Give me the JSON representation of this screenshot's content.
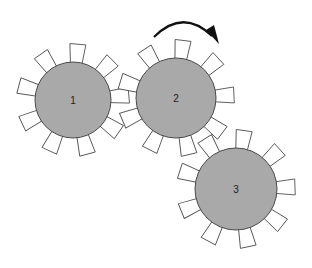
{
  "diagram": {
    "type": "gear-train",
    "colors": {
      "gear_fill": "#a9a9a9",
      "gear_stroke": "#4a4a4a",
      "tooth_fill": "#ffffff",
      "tooth_stroke": "#555555",
      "arrow": "#111111"
    },
    "tooth": {
      "length": 18,
      "base_width": 11,
      "tip_width": 16
    },
    "gears": [
      {
        "id": "gear-1",
        "label": "1",
        "cx": 73,
        "cy": 100,
        "r": 38,
        "teeth": 9,
        "start_angle": -5
      },
      {
        "id": "gear-2",
        "label": "2",
        "cx": 176,
        "cy": 98,
        "r": 40,
        "teeth": 9,
        "start_angle": -83
      },
      {
        "id": "gear-3",
        "label": "3",
        "cx": 236,
        "cy": 189,
        "r": 41,
        "teeth": 9,
        "start_angle": -2
      }
    ],
    "rotation_arrow": {
      "target_gear": "2",
      "direction": "clockwise",
      "path": "M 154 37 Q 183 8 212 36",
      "head": "206,30 219,44 214,25"
    }
  }
}
